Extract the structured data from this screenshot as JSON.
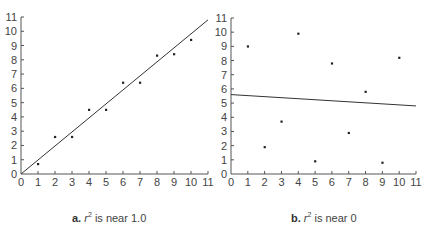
{
  "chart_data": [
    {
      "type": "scatter",
      "panel_label": "a.",
      "caption_rest": "is near 1.0",
      "caption": "a. r² is near 1.0",
      "xlabel": "",
      "ylabel": "",
      "xlim": [
        0,
        11
      ],
      "ylim": [
        0,
        11
      ],
      "xticks": [
        0,
        1,
        2,
        3,
        4,
        5,
        6,
        7,
        8,
        9,
        10,
        11
      ],
      "yticks": [
        0,
        1,
        2,
        3,
        4,
        5,
        6,
        7,
        8,
        9,
        10,
        11
      ],
      "grid": false,
      "points": [
        {
          "x": 1,
          "y": 0.7
        },
        {
          "x": 2,
          "y": 2.6
        },
        {
          "x": 3,
          "y": 2.6
        },
        {
          "x": 4,
          "y": 4.5
        },
        {
          "x": 5,
          "y": 4.5
        },
        {
          "x": 6,
          "y": 6.4
        },
        {
          "x": 7,
          "y": 6.4
        },
        {
          "x": 8,
          "y": 8.3
        },
        {
          "x": 9,
          "y": 8.4
        },
        {
          "x": 10,
          "y": 9.4
        }
      ],
      "fit_line": {
        "x0": 0,
        "y0": 0,
        "x1": 11,
        "y1": 10.8
      }
    },
    {
      "type": "scatter",
      "panel_label": "b.",
      "caption_rest": "is near 0",
      "caption": "b. r² is near 0",
      "xlabel": "",
      "ylabel": "",
      "xlim": [
        0,
        11
      ],
      "ylim": [
        0,
        11
      ],
      "xticks": [
        0,
        1,
        2,
        3,
        4,
        5,
        6,
        7,
        8,
        9,
        10,
        11
      ],
      "yticks": [
        0,
        1,
        2,
        3,
        4,
        5,
        6,
        7,
        8,
        9,
        10,
        11
      ],
      "grid": false,
      "points": [
        {
          "x": 1,
          "y": 9.0
        },
        {
          "x": 2,
          "y": 1.9
        },
        {
          "x": 3,
          "y": 3.7
        },
        {
          "x": 4,
          "y": 9.9
        },
        {
          "x": 5,
          "y": 0.9
        },
        {
          "x": 6,
          "y": 7.8
        },
        {
          "x": 7,
          "y": 2.9
        },
        {
          "x": 8,
          "y": 5.8
        },
        {
          "x": 9,
          "y": 0.8
        },
        {
          "x": 10,
          "y": 8.2
        }
      ],
      "fit_line": {
        "x0": 0,
        "y0": 5.6,
        "x1": 11,
        "y1": 4.8
      }
    }
  ],
  "captions": {
    "a": {
      "label": "a.",
      "symbol": "r",
      "exp": "2",
      "rest": " is near 1.0"
    },
    "b": {
      "label": "b.",
      "symbol": "r",
      "exp": "2",
      "rest": " is near 0"
    }
  },
  "colors": {
    "axis": "#555555",
    "text": "#444444",
    "point": "#222222",
    "line": "#333333"
  }
}
